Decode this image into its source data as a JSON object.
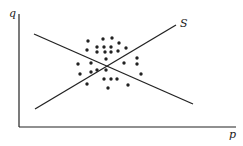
{
  "chart_data": {
    "type": "scatter",
    "title": "",
    "xlabel": "p",
    "ylabel": "q",
    "grid": false,
    "lines": [
      {
        "name": "demand",
        "label": "",
        "x1": 34,
        "y1": 34,
        "x2": 193,
        "y2": 104
      },
      {
        "name": "supply",
        "label": "S",
        "x1": 35,
        "y1": 109,
        "x2": 176,
        "y2": 25
      }
    ],
    "points": [
      [
        88,
        41
      ],
      [
        103,
        39
      ],
      [
        112,
        38
      ],
      [
        87,
        50
      ],
      [
        97,
        47
      ],
      [
        104,
        47
      ],
      [
        111,
        47
      ],
      [
        119,
        43
      ],
      [
        97,
        52
      ],
      [
        105,
        52
      ],
      [
        111,
        52
      ],
      [
        118,
        51
      ],
      [
        126,
        48
      ],
      [
        78,
        64
      ],
      [
        91,
        63
      ],
      [
        106,
        59
      ],
      [
        124,
        63
      ],
      [
        137,
        58
      ],
      [
        137,
        64
      ],
      [
        80,
        74
      ],
      [
        91,
        72
      ],
      [
        97,
        70
      ],
      [
        106,
        70
      ],
      [
        141,
        74
      ],
      [
        87,
        84
      ],
      [
        104,
        79
      ],
      [
        111,
        79
      ],
      [
        117,
        79
      ],
      [
        128,
        85
      ],
      [
        108,
        88
      ]
    ]
  },
  "labels": {
    "x_axis": "p",
    "y_axis": "q",
    "supply_line": "S"
  },
  "colors": {
    "ink": "#222222",
    "background": "#ffffff"
  }
}
